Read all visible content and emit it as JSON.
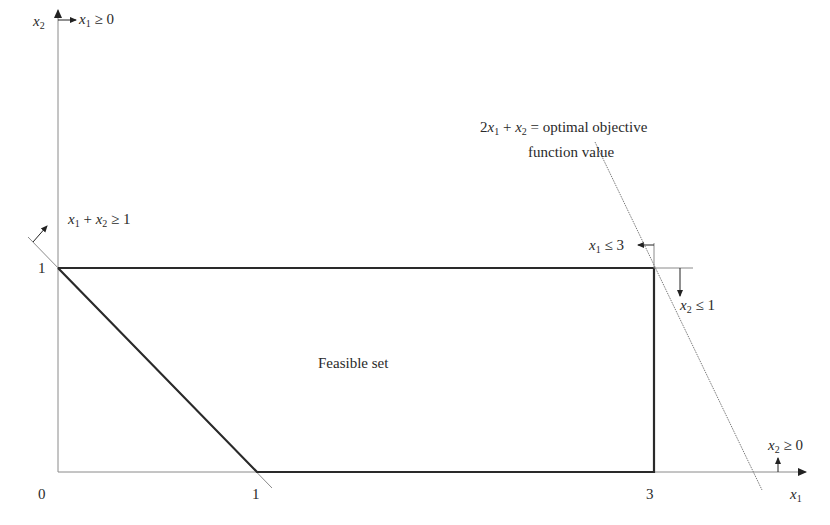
{
  "diagram": {
    "type": "linear-programming-feasible-region",
    "axes": {
      "x": {
        "label_var": "x",
        "label_sub": "1",
        "ticks": [
          "0",
          "1",
          "3"
        ]
      },
      "y": {
        "label_var": "x",
        "label_sub": "2",
        "ticks": [
          "1"
        ]
      }
    },
    "region_label": "Feasible set",
    "constraints": [
      {
        "id": "x1-nonneg",
        "var": "x",
        "sub": "1",
        "rel": "≥ 0"
      },
      {
        "id": "x1-plus-x2",
        "text_a": "x",
        "sub_a": "1",
        "mid": " + ",
        "text_b": "x",
        "sub_b": "2",
        "rel": "≥ 1"
      },
      {
        "id": "x1-le-3",
        "var": "x",
        "sub": "1",
        "rel": "≤ 3"
      },
      {
        "id": "x2-le-1",
        "var": "x",
        "sub": "2",
        "rel": "≤ 1"
      },
      {
        "id": "x2-nonneg",
        "var": "x",
        "sub": "2",
        "rel": "≥ 0"
      }
    ],
    "objective": {
      "coef": "2",
      "var_a": "x",
      "sub_a": "1",
      "mid": " + ",
      "var_b": "x",
      "sub_b": "2",
      "line1_rest": " = optimal objective",
      "line2": "function value"
    },
    "vertices": [
      [
        0,
        1
      ],
      [
        1,
        0
      ],
      [
        3,
        0
      ],
      [
        3,
        1
      ]
    ],
    "colors": {
      "ink": "#2a2a2a",
      "thin": "#8a8a8a",
      "background": "#ffffff"
    }
  }
}
